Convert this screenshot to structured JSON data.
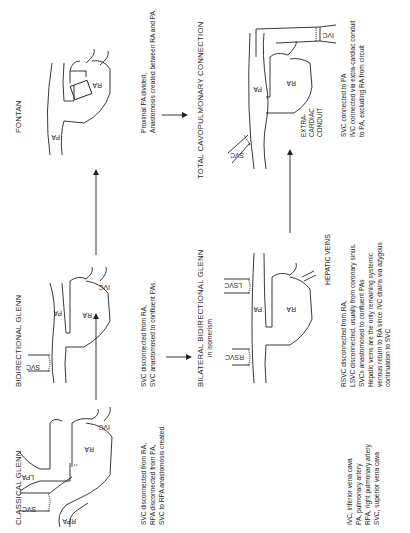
{
  "panels": {
    "classical_glenn": {
      "title": "CLASSICAL GLENN",
      "labels": {
        "svc": "SVC",
        "rpa": "RPA",
        "lpa": "LPA",
        "ra": "RA",
        "ivc": "IVC"
      },
      "description": [
        "SVC disconnected from RA,",
        "RPA disconnected from PA,",
        "SVC to RPA anastomosis created."
      ]
    },
    "bidirectional_glenn": {
      "title": "BIDIRECTIONAL GLENN",
      "labels": {
        "svc": "SVC",
        "pa": "PA",
        "ra": "RA",
        "ivc": "IVC"
      },
      "description": [
        "SVC disconnected from RA,",
        "SVC anastomosed to confluent PAs."
      ]
    },
    "fontan": {
      "title": "FONTAN",
      "labels": {
        "pa": "PA",
        "ra": "RA"
      },
      "description": [
        "Proximal PA divided,",
        "Anastomosis created between RA and PA"
      ]
    },
    "bilateral_bidirectional_glenn": {
      "title": "BILATERAL BIDIRECTIONAL GLENN",
      "subtitle": "in isomerism",
      "labels": {
        "rsvc": "RSVC",
        "lsvc": "LSVC",
        "pa": "PA",
        "ra": "RA",
        "hepatic": "HEPATIC VEINS"
      },
      "description": [
        "RSVC disconnected from RA,",
        "LSVC disconnected, usually from coronary sinus.",
        "SVCs anastomosed to confluent PAs",
        "Hepatic veins are the only remaining systemic",
        "venous return to RA since IVC drains via azygous",
        "continuation to SVC"
      ]
    },
    "tcpc": {
      "title": "TOTAL CAVOPULMONARY CONNECTION",
      "labels": {
        "svc": "SVC",
        "pa": "PA",
        "ra": "RA",
        "ivc": "IVC",
        "conduit": [
          "EXTRA-",
          "CARDIAC",
          "CONDUIT"
        ]
      },
      "description": [
        "SVC connected to PA",
        "IVC connected via extra-cardiac conduit",
        "to PA, excluding RA from circuit"
      ]
    }
  },
  "legend": [
    "IVC, inferior vena cava",
    "PA, pulmonary artery",
    "RPA, right pulmonary artery",
    "SVC, superior vena cava"
  ]
}
